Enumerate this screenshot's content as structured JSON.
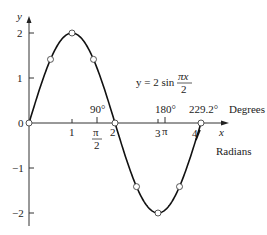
{
  "chart_data": {
    "type": "line",
    "title": "",
    "equation": "y = 2 sin πx/2",
    "equation_parts": {
      "lhs": "y = 2 sin",
      "num": "πx",
      "den": "2"
    },
    "xlabel": "x",
    "ylabel": "y",
    "x_units_label": "Radians",
    "degree_units_label": "Degrees",
    "xlim": [
      0,
      4.3
    ],
    "ylim": [
      -2.2,
      2.3
    ],
    "grid": false,
    "x_ticks": [
      "1",
      "2",
      "3",
      "4"
    ],
    "x_special_ticks": [
      {
        "value": 1.5708,
        "label_num": "π",
        "label_den": "2",
        "degree_label": "90°"
      },
      {
        "value": 3.1416,
        "label": "π",
        "degree_label": "180°"
      },
      {
        "value": 4.0,
        "degree_label": "229.2°"
      }
    ],
    "y_ticks": [
      "2",
      "1",
      "0",
      "−1",
      "−2"
    ],
    "series": [
      {
        "name": "y = 2 sin(πx/2)",
        "marked_points": [
          {
            "x": 0,
            "y": 0
          },
          {
            "x": 0.5,
            "y": 1.414
          },
          {
            "x": 1,
            "y": 2
          },
          {
            "x": 1.5,
            "y": 1.414
          },
          {
            "x": 2,
            "y": 0
          },
          {
            "x": 2.5,
            "y": -1.414
          },
          {
            "x": 3,
            "y": -2
          },
          {
            "x": 3.5,
            "y": -1.414
          },
          {
            "x": 4,
            "y": 0
          }
        ]
      }
    ]
  },
  "labels": {
    "y_axis": "y",
    "x_axis": "x",
    "zero": "0",
    "y2": "2",
    "y1": "1",
    "yn1": "−1",
    "yn2": "−2",
    "x1": "1",
    "x2": "2",
    "x3": "3",
    "x4": "4",
    "pi": "π",
    "pi_half_num": "π",
    "pi_half_den": "2",
    "deg90": "90°",
    "deg180": "180°",
    "deg229": "229.2°",
    "degrees": "Degrees",
    "radians": "Radians",
    "eq_lhs": "y = 2 sin",
    "eq_num": "πx",
    "eq_den": "2"
  }
}
